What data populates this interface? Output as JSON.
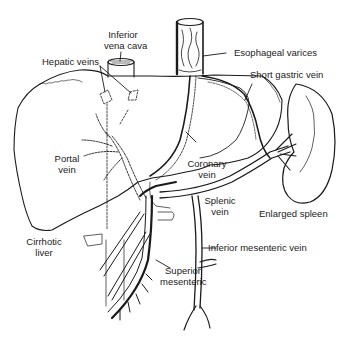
{
  "diagram": {
    "colors": {
      "ink": "#1a1a1a",
      "label": "#222222",
      "background": "#ffffff"
    },
    "labels": {
      "inferior_vena_cava": [
        "Inferior",
        "vena cava"
      ],
      "hepatic_veins": "Hepatic veins",
      "esophageal_varices": "Esophageal varices",
      "short_gastric_vein": "Short gastric vein",
      "portal_vein": [
        "Portal",
        "vein"
      ],
      "coronary_vein": [
        "Coronary",
        "vein"
      ],
      "splenic_vein": [
        "Splenic",
        "vein"
      ],
      "enlarged_spleen": "Enlarged spleen",
      "cirrhotic_liver": [
        "Cirrhotic",
        "liver"
      ],
      "inferior_mesenteric_vein": "Inferior mesenteric vein",
      "superior_mesenteric": [
        "Superior",
        "mesenteric"
      ]
    }
  }
}
